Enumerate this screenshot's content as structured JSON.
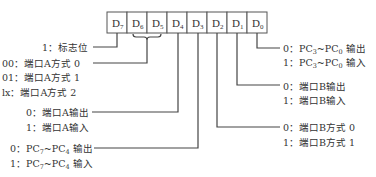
{
  "register": {
    "bits": [
      {
        "base": "D",
        "sub": "7"
      },
      {
        "base": "D",
        "sub": "6"
      },
      {
        "base": "D",
        "sub": "5"
      },
      {
        "base": "D",
        "sub": "4"
      },
      {
        "base": "D",
        "sub": "3"
      },
      {
        "base": "D",
        "sub": "2"
      },
      {
        "base": "D",
        "sub": "1"
      },
      {
        "base": "D",
        "sub": "0"
      }
    ]
  },
  "annotations": {
    "d7": {
      "line1": "1：标志位"
    },
    "d6d5": {
      "line1": "00：端口A方式 0",
      "line2": "01：端口A方式 1",
      "line3": "lx：端口A方式 2"
    },
    "d4": {
      "line1": "0：端口A输出",
      "line2": "1：端口A输入"
    },
    "d3": {
      "line1_prefix": "0：PC",
      "line1_sub1": "7",
      "line1_mid": "~PC",
      "line1_sub2": "4",
      "line1_suffix": " 输出",
      "line2_prefix": "1：PC",
      "line2_sub1": "7",
      "line2_mid": "~PC",
      "line2_sub2": "4",
      "line2_suffix": " 输入"
    },
    "d2": {
      "line1": "0：端口B方式 0",
      "line2": "1：端口B方式 1"
    },
    "d1": {
      "line1": "0：端口B输出",
      "line2": "1：端口B输入"
    },
    "d0": {
      "line1_prefix": "0：PC",
      "line1_sub1": "3",
      "line1_mid": "~PC",
      "line1_sub2": "0",
      "line1_suffix": " 输出",
      "line2_prefix": "1：PC",
      "line2_sub1": "3",
      "line2_mid": "~PC",
      "line2_sub2": "0",
      "line2_suffix": " 输入"
    }
  },
  "colors": {
    "line": "#444444",
    "text": "#333333",
    "background": "#ffffff"
  }
}
